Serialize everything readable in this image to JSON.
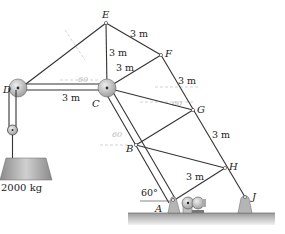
{
  "figure": {
    "nodes": {
      "A": {
        "label": "A",
        "x": 173,
        "y": 201
      },
      "B": {
        "label": "B",
        "x": 136,
        "y": 145
      },
      "C": {
        "label": "C",
        "x": 107,
        "y": 88
      },
      "D": {
        "label": "D",
        "x": 18,
        "y": 90
      },
      "E": {
        "label": "E",
        "x": 106,
        "y": 23
      },
      "F": {
        "label": "F",
        "x": 161,
        "y": 55
      },
      "G": {
        "label": "G",
        "x": 193,
        "y": 110
      },
      "H": {
        "label": "H",
        "x": 225,
        "y": 168
      },
      "J": {
        "label": "J",
        "x": 245,
        "y": 197
      }
    },
    "dimensions": {
      "EF": "3 m",
      "EC": "3 m",
      "CF": "3 m",
      "DC": "3 m",
      "FG": "3 m",
      "GH": "3 m",
      "AH": "3 m"
    },
    "angle_label": "60°",
    "mass_label": "2000 kg",
    "faint_annotations": [
      "60",
      "60",
      "60"
    ],
    "colors": {
      "line": "#333333",
      "pulley": "#b8b8b8",
      "weight": "#a8a8a8",
      "ground": "#c4c4c4"
    }
  }
}
